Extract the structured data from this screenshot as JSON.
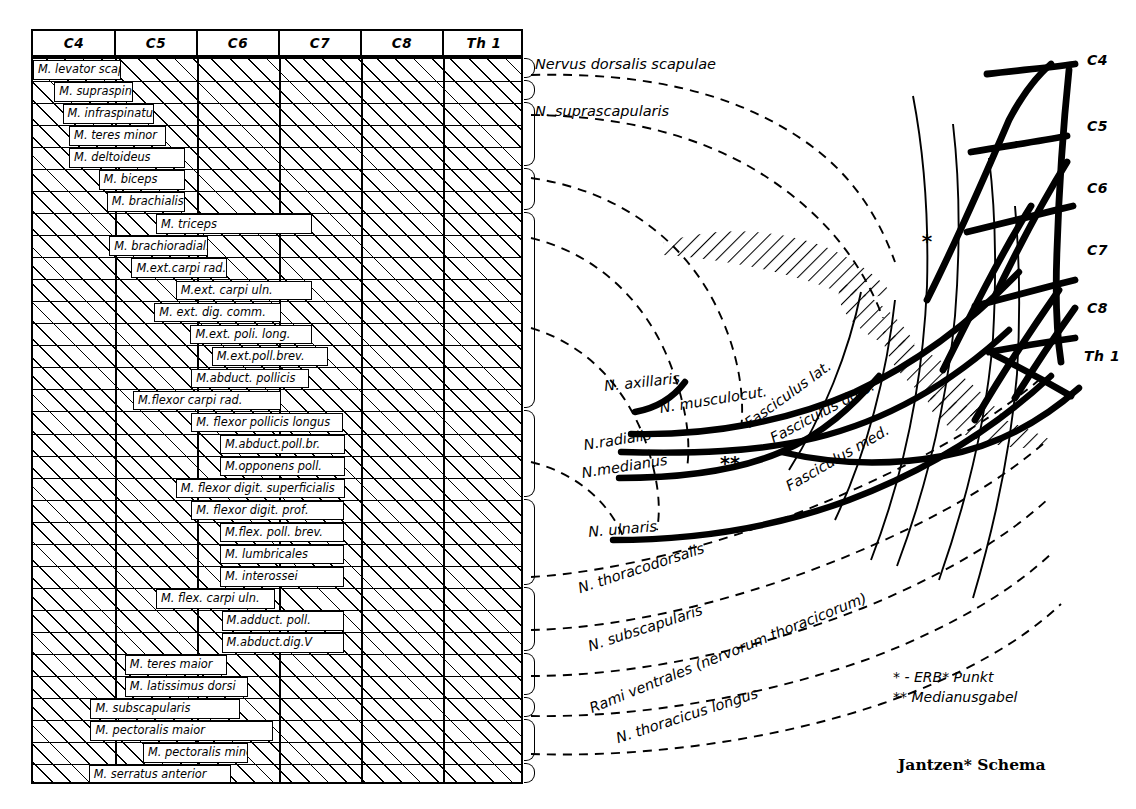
{
  "signature": "Jantzen* Schema",
  "corner_mark": "1181",
  "table": {
    "columns": [
      "C4",
      "C5",
      "C6",
      "C7",
      "C8",
      "Th 1"
    ],
    "rows": [
      {
        "label": "M. levator scapulae",
        "start": 0.0,
        "end": 1.07
      },
      {
        "label": "M. supraspinatus",
        "start": 0.26,
        "end": 1.22
      },
      {
        "label": "M. infraspinatus",
        "start": 0.36,
        "end": 1.48
      },
      {
        "label": "M. teres minor",
        "start": 0.44,
        "end": 1.62
      },
      {
        "label": "M. deltoideus",
        "start": 0.44,
        "end": 1.85
      },
      {
        "label": "M. biceps",
        "start": 0.8,
        "end": 1.85
      },
      {
        "label": "M. brachialis",
        "start": 0.9,
        "end": 1.85
      },
      {
        "label": "M. triceps",
        "start": 1.5,
        "end": 3.4
      },
      {
        "label": "M. brachioradial.",
        "start": 0.93,
        "end": 2.14
      },
      {
        "label": "M.ext.carpi rad.(l+b)",
        "start": 1.2,
        "end": 2.37
      },
      {
        "label": "M.ext. carpi uln.",
        "start": 1.74,
        "end": 3.4
      },
      {
        "label": "M. ext. dig. comm.",
        "start": 1.48,
        "end": 3.02
      },
      {
        "label": "M.ext. poli. long.",
        "start": 1.92,
        "end": 3.4
      },
      {
        "label": "M.ext.poll.brev.",
        "start": 2.18,
        "end": 3.6
      },
      {
        "label": "M.abduct. pollicis",
        "start": 1.93,
        "end": 3.37
      },
      {
        "label": "M.flexor carpi rad.",
        "start": 1.22,
        "end": 3.02
      },
      {
        "label": "M. flexor pollicis longus",
        "start": 1.93,
        "end": 3.78
      },
      {
        "label": "M.abduct.poll.br.",
        "start": 2.28,
        "end": 3.8
      },
      {
        "label": "M.opponens poll.",
        "start": 2.28,
        "end": 3.8
      },
      {
        "label": "M. flexor digit. superficialis",
        "start": 1.74,
        "end": 3.8
      },
      {
        "label": "M. flexor digit. prof.",
        "start": 1.93,
        "end": 3.79
      },
      {
        "label": "M.flex. poll. brev.",
        "start": 2.28,
        "end": 3.79
      },
      {
        "label": "M. lumbricales",
        "start": 2.28,
        "end": 3.79
      },
      {
        "label": "M. interossei",
        "start": 2.28,
        "end": 3.79
      },
      {
        "label": "M. flex. carpi uln.",
        "start": 1.5,
        "end": 2.95
      },
      {
        "label": "M.adduct. poll.",
        "start": 2.3,
        "end": 3.79
      },
      {
        "label": "M.abduct.dig.V",
        "start": 2.3,
        "end": 3.79
      },
      {
        "label": "M. teres maior",
        "start": 1.12,
        "end": 2.37
      },
      {
        "label": "M. latissimus dorsi",
        "start": 1.12,
        "end": 2.62
      },
      {
        "label": "M. subscapularis",
        "start": 0.7,
        "end": 2.52
      },
      {
        "label": "M. pectoralis maior",
        "start": 0.7,
        "end": 2.93
      },
      {
        "label": "M. pectoralis minor",
        "start": 1.34,
        "end": 2.62
      },
      {
        "label": "M. serratus anterior",
        "start": 0.68,
        "end": 2.42
      }
    ],
    "braces": [
      {
        "from": 0,
        "to": 0
      },
      {
        "from": 1,
        "to": 1
      },
      {
        "from": 2,
        "to": 4
      },
      {
        "from": 5,
        "to": 6
      },
      {
        "from": 7,
        "to": 15
      },
      {
        "from": 16,
        "to": 19
      },
      {
        "from": 20,
        "to": 23
      },
      {
        "from": 24,
        "to": 26
      },
      {
        "from": 27,
        "to": 28
      },
      {
        "from": 29,
        "to": 29
      },
      {
        "from": 30,
        "to": 31
      },
      {
        "from": 32,
        "to": 32
      }
    ]
  },
  "nerves": [
    {
      "id": "n-dorsalis-scapulae",
      "label": "Nervus dorsalis scapulae"
    },
    {
      "id": "n-suprascapularis",
      "label": "N. suprascapularis"
    },
    {
      "id": "n-axillaris",
      "label": "N. axillaris"
    },
    {
      "id": "n-musculocutaneus",
      "label": "N. musculocut."
    },
    {
      "id": "n-radialis",
      "label": "N.radialis"
    },
    {
      "id": "n-medianus",
      "label": "N.medianus"
    },
    {
      "id": "n-ulnaris",
      "label": "N. ulnaris"
    },
    {
      "id": "n-thoracodorsalis",
      "label": "N. thoracodorsalis"
    },
    {
      "id": "n-subscapularis",
      "label": "N. subscapularis"
    },
    {
      "id": "rami-ventrales",
      "label": "Rami ventrales (nervorum thoracicorum)"
    },
    {
      "id": "n-thoracicus-longus",
      "label": "N. thoracicus longus"
    }
  ],
  "fasciculi": [
    {
      "id": "fasciculus-lat",
      "label": "Fasciculus lat."
    },
    {
      "id": "fasciculus-dors",
      "label": "Fasciculus dors."
    },
    {
      "id": "fasciculus-med",
      "label": "Fasciculus med."
    }
  ],
  "roots": [
    "C4",
    "C5",
    "C6",
    "C7",
    "C8",
    "Th 1"
  ],
  "markers": {
    "erb_point": "*",
    "medianusgabel": "**"
  },
  "legend": [
    {
      "symbol": "*",
      "sep": "-",
      "pre": "E",
      "sc": "RB",
      "post": "* Punkt",
      "text": "* -  ERB* Punkt"
    },
    {
      "symbol": "**",
      "text": "** Medianusgabel"
    }
  ],
  "legend_lines": {
    "erb": "Punkt",
    "erb_name": "E",
    "erb_small": "RB",
    "median": "Medianusgabel"
  }
}
